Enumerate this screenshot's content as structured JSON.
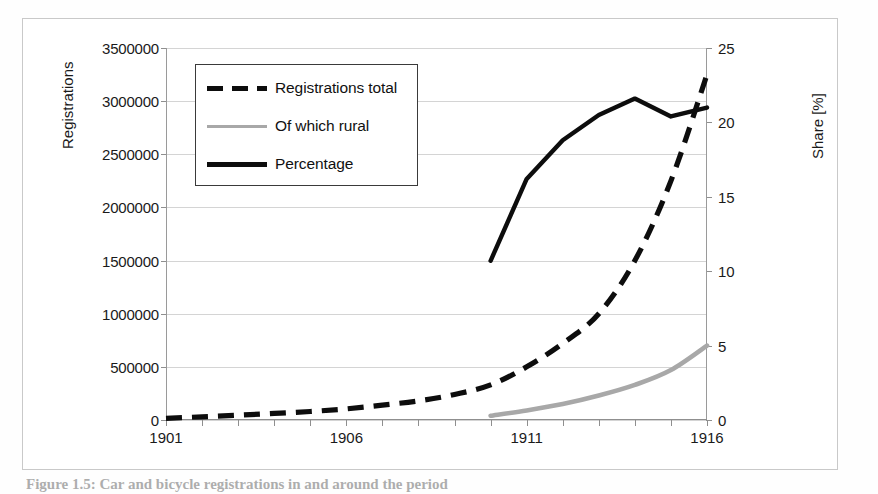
{
  "figure": {
    "caption": "Figure 1.5: Car and bicycle registrations in and around the period"
  },
  "axes": {
    "left_title": "Registrations",
    "right_title": "Share [%]",
    "left_ticks": [
      "0",
      "500000",
      "1000000",
      "1500000",
      "2000000",
      "2500000",
      "3000000",
      "3500000"
    ],
    "right_ticks": [
      "0",
      "5",
      "10",
      "15",
      "20",
      "25"
    ],
    "x_ticks": [
      "1901",
      "1906",
      "1911",
      "1916"
    ]
  },
  "legend": {
    "items": [
      {
        "label": "Registrations total",
        "style": "dashed",
        "color": "#0d0d0d"
      },
      {
        "label": "Of which rural",
        "style": "solid",
        "color": "#a8a8a8"
      },
      {
        "label": "Percentage",
        "style": "solid",
        "color": "#0d0d0d"
      }
    ]
  },
  "chart_data": {
    "type": "line",
    "title": "",
    "xlabel": "",
    "ylabel": "Registrations",
    "y2label": "Share [%]",
    "grid": true,
    "legend_position": "top-left",
    "x": [
      1901,
      1902,
      1903,
      1904,
      1905,
      1906,
      1907,
      1908,
      1909,
      1910,
      1911,
      1912,
      1913,
      1914,
      1915,
      1916
    ],
    "xlim": [
      1901,
      1916
    ],
    "ylim": [
      0,
      3500000
    ],
    "y2lim": [
      0,
      25
    ],
    "series": [
      {
        "name": "Registrations total",
        "axis": "left",
        "style": "dashed",
        "color": "#0d0d0d",
        "values": [
          15000,
          30000,
          45000,
          62000,
          80000,
          105000,
          140000,
          180000,
          240000,
          330000,
          500000,
          720000,
          1000000,
          1500000,
          2250000,
          3250000
        ]
      },
      {
        "name": "Of which rural",
        "axis": "left",
        "style": "solid",
        "color": "#a8a8a8",
        "values": [
          null,
          null,
          null,
          null,
          null,
          null,
          null,
          null,
          null,
          40000,
          90000,
          150000,
          230000,
          330000,
          470000,
          700000
        ]
      },
      {
        "name": "Percentage",
        "axis": "right",
        "style": "solid",
        "color": "#0d0d0d",
        "values": [
          null,
          null,
          null,
          null,
          null,
          null,
          null,
          null,
          null,
          10.7,
          16.2,
          18.8,
          20.5,
          21.6,
          20.4,
          21.0
        ]
      }
    ]
  }
}
